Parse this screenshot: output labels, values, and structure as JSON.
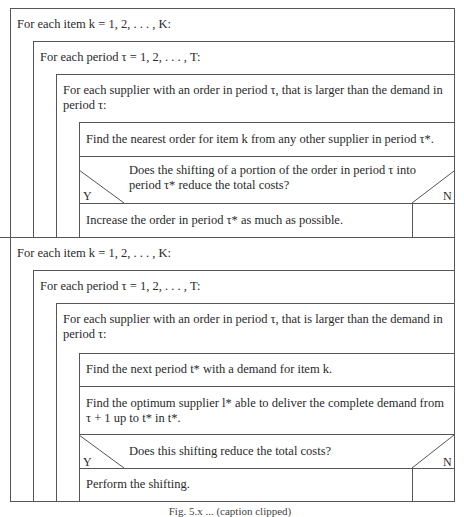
{
  "diagram": {
    "type": "nassi-shneiderman structogram",
    "sections": [
      {
        "loop1": "For each item k = 1, 2, . . . , K:",
        "loop2": "For each period τ = 1, 2, . . . , T:",
        "loop3_line1": "For each supplier with an order in period τ, that is larger than the demand in",
        "loop3_line2": "period τ:",
        "step1": "Find the nearest order for item k from any other supplier in period τ*.",
        "decision_line1": "Does the shifting of a portion of the order in period τ into",
        "decision_line2": "period τ* reduce the total costs?",
        "yes_label": "Y",
        "no_label": "N",
        "yes_action": "Increase the order in period τ* as much as possible.",
        "no_action": ""
      },
      {
        "loop1": "For each item k = 1, 2, . . . , K:",
        "loop2": "For each period τ = 1, 2, . . . , T:",
        "loop3_line1": "For each supplier with an order in period τ, that is larger than the demand in",
        "loop3_line2": "period τ:",
        "step1": "Find the next period t* with a demand for item k.",
        "step2_line1": "Find the optimum supplier l* able to deliver the complete demand from",
        "step2_line2": "τ + 1 up to t* in t*.",
        "decision_line1": "Does this shifting reduce the total costs?",
        "yes_label": "Y",
        "no_label": "N",
        "yes_action": "Perform the shifting.",
        "no_action": ""
      }
    ],
    "caption": "Fig. 5.x ... (caption clipped)"
  }
}
